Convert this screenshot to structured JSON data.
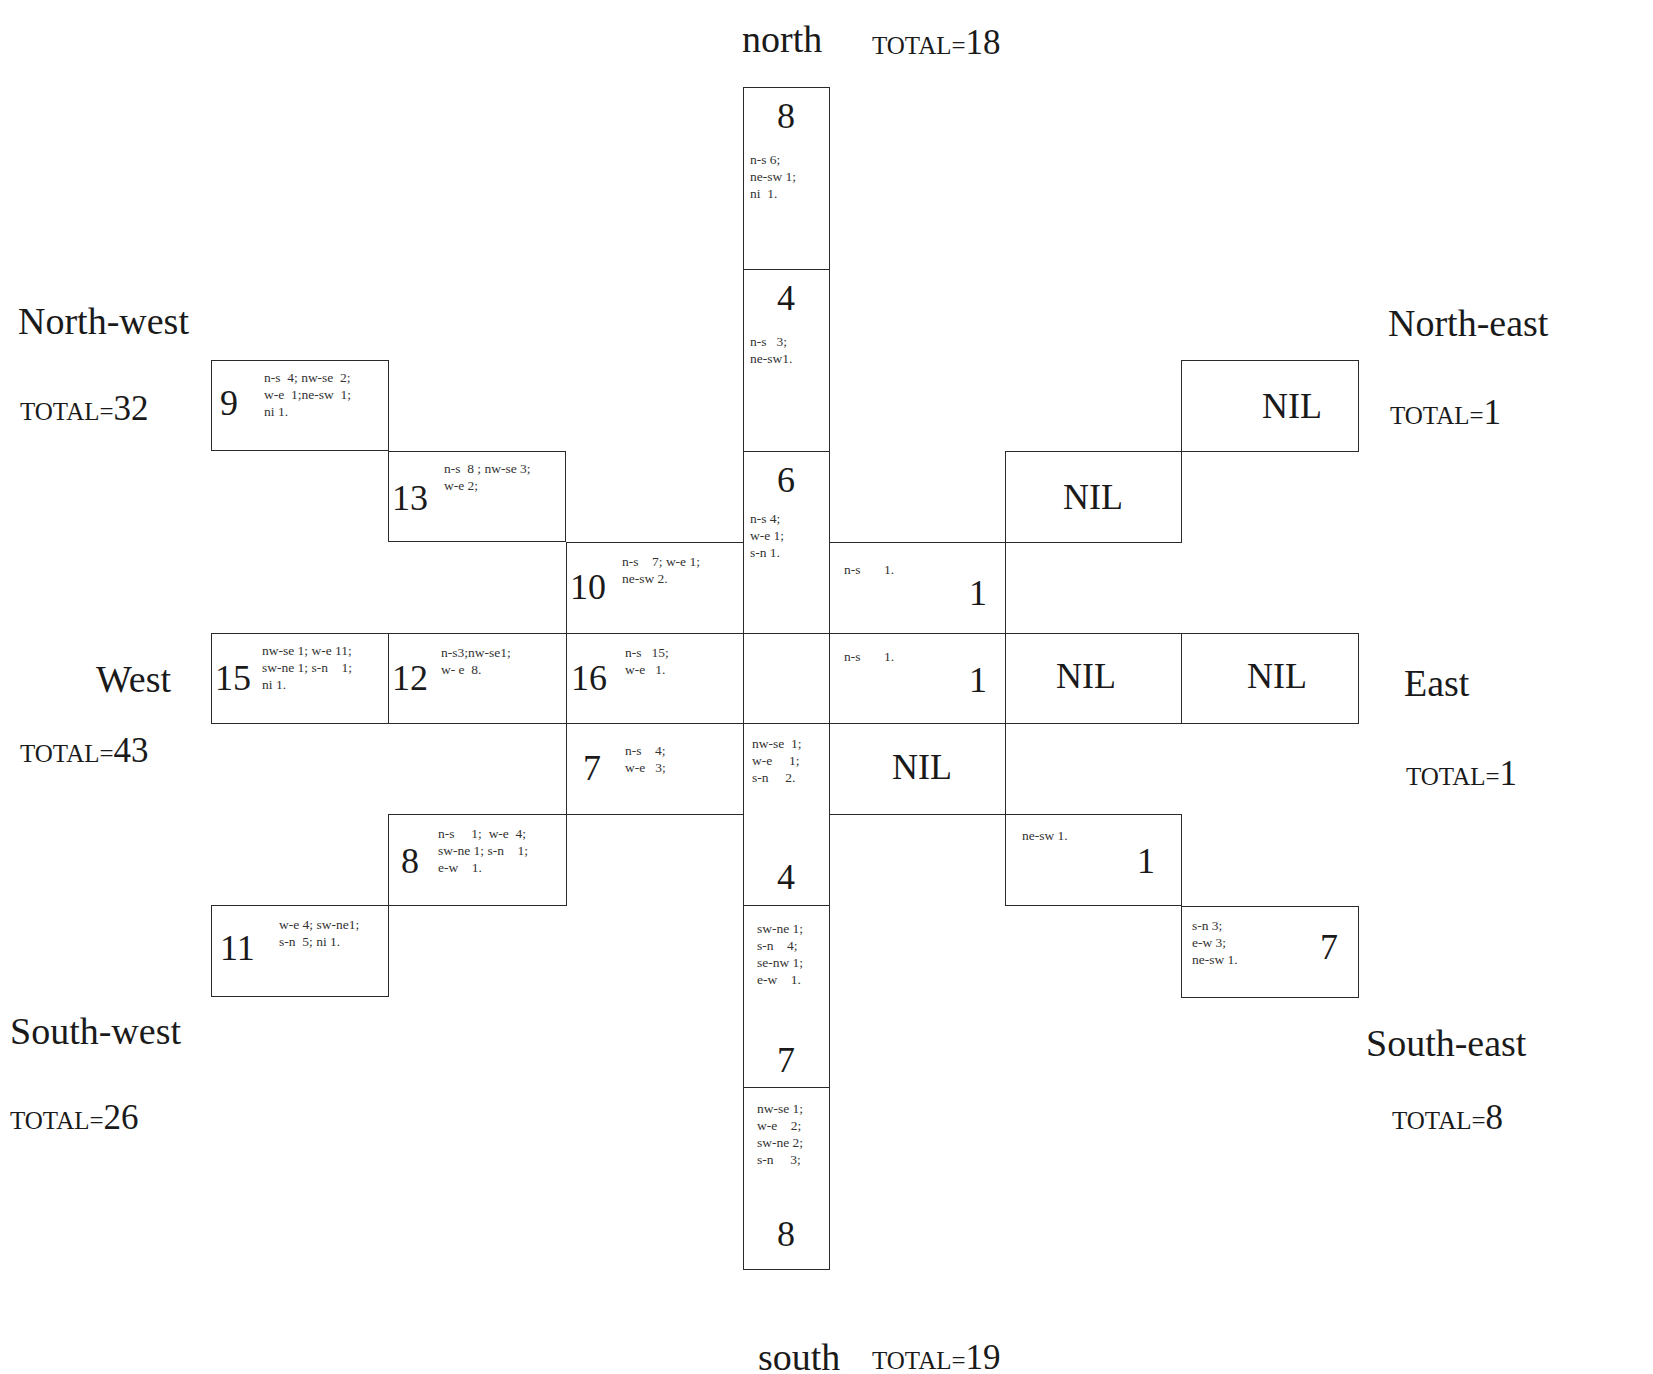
{
  "directions": {
    "north": {
      "label": "north",
      "total_prefix": "TOTAL=",
      "total": "18"
    },
    "north_west": {
      "label": "North-west",
      "total_prefix": "TOTAL=",
      "total": "32"
    },
    "north_east": {
      "label": "North-east",
      "total_prefix": "TOTAL=",
      "total": "1"
    },
    "west": {
      "label": "West",
      "total_prefix": "TOTAL=",
      "total": "43"
    },
    "east": {
      "label": "East",
      "total_prefix": "TOTAL=",
      "total": "1"
    },
    "south_west": {
      "label": "South-west",
      "total_prefix": "TOTAL=",
      "total": "26"
    },
    "south_east": {
      "label": "South-east",
      "total_prefix": "TOTAL=",
      "total": "8"
    },
    "south": {
      "label": "south",
      "total_prefix": "TOTAL=",
      "total": "19"
    }
  },
  "cells": {
    "n1": {
      "count": "8",
      "note": "n-s 6;\nne-sw 1;\nni  1."
    },
    "n2": {
      "count": "4",
      "note": "n-s   3;\nne-sw1."
    },
    "n3": {
      "count": "6",
      "note": "n-s 4;\nw-e 1;\ns-n 1."
    },
    "center": {
      "count": "",
      "note": ""
    },
    "s1": {
      "count": "4",
      "note": "nw-se  1;\nw-e     1;\ns-n     2."
    },
    "s2": {
      "count": "7",
      "note": "sw-ne 1;\ns-n    4;\nse-nw 1;\ne-w    1."
    },
    "s3": {
      "count": "8",
      "note": "nw-se 1;\nw-e    2;\nsw-ne 2;\ns-n     3;"
    },
    "nw1": {
      "count": "9",
      "note": "n-s  4; nw-se  2;\nw-e  1;ne-sw  1;\nni 1."
    },
    "nw2": {
      "count": "13",
      "note": "n-s  8 ; nw-se 3;\nw-e 2;"
    },
    "nw3": {
      "count": "10",
      "note": "n-s    7; w-e 1;\nne-sw 2."
    },
    "w1": {
      "count": "15",
      "note": "nw-se 1; w-e 11;\nsw-ne 1; s-n    1;\nni 1."
    },
    "w2": {
      "count": "12",
      "note": "n-s3;nw-se1;\nw- e  8."
    },
    "w3": {
      "count": "16",
      "note": "n-s   15;\nw-e   1."
    },
    "sw1": {
      "count": "7",
      "note": "n-s    4;\nw-e   3;"
    },
    "sw2": {
      "count": "8",
      "note": "n-s     1;  w-e  4;\nsw-ne 1; s-n    1;\ne-w    1."
    },
    "sw3": {
      "count": "11",
      "note": "w-e 4; sw-ne1;\ns-n  5; ni 1."
    },
    "ne1": {
      "count": "1",
      "note": "n-s       1."
    },
    "ne2": {
      "count": "NIL",
      "note": ""
    },
    "ne3": {
      "count": "NIL",
      "note": ""
    },
    "e1": {
      "count": "1",
      "note": "n-s       1."
    },
    "e2": {
      "count": "NIL",
      "note": ""
    },
    "e3": {
      "count": "NIL",
      "note": ""
    },
    "se1": {
      "count": "NIL",
      "note": ""
    },
    "se2": {
      "count": "1",
      "note": "ne-sw 1."
    },
    "se3": {
      "count": "7",
      "note": "s-n 3;\ne-w 3;\nne-sw 1."
    }
  }
}
